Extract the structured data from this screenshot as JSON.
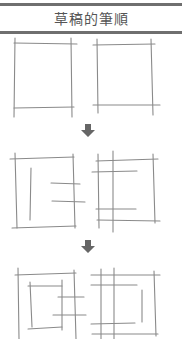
{
  "header": {
    "title": "草稿的筆順"
  },
  "steps": [
    {
      "label": "step-1-outer-frames"
    },
    {
      "label": "step-2-inner-strokes"
    },
    {
      "label": "step-3-completed"
    }
  ],
  "icons": {
    "arrow": "down-arrow-icon"
  },
  "colors": {
    "rule": "#6f6f6f",
    "stroke": "#8a8a8a",
    "arrow": "#666666"
  }
}
